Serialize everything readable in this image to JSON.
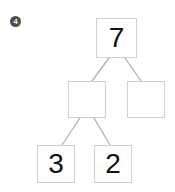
{
  "page": {
    "problem_marker": "4",
    "marker_shape": "filled-circle",
    "marker_color": "#4d4d4d",
    "background_color": "#ffffff",
    "box_border_color": "#cfcfcf",
    "connector_color": "#b0b0b0",
    "value_color": "#111111"
  },
  "diagram": {
    "type": "number-bond-tree",
    "nodes": [
      {
        "id": "root",
        "value": "7",
        "empty": false
      },
      {
        "id": "mid_left",
        "value": "",
        "empty": true
      },
      {
        "id": "mid_right",
        "value": "",
        "empty": true
      },
      {
        "id": "leaf_left",
        "value": "3",
        "empty": false
      },
      {
        "id": "leaf_right",
        "value": "2",
        "empty": false
      }
    ],
    "edges": [
      {
        "from": "root",
        "to": "mid_left"
      },
      {
        "from": "root",
        "to": "mid_right"
      },
      {
        "from": "mid_left",
        "to": "leaf_left"
      },
      {
        "from": "mid_left",
        "to": "leaf_right"
      }
    ]
  }
}
